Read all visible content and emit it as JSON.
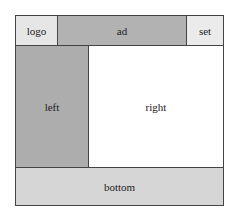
{
  "layout": {
    "logo": "logo",
    "ad": "ad",
    "set": "set",
    "left": "left",
    "right": "right",
    "bottom": "bottom"
  },
  "colors": {
    "logo": "#e6e6e6",
    "ad": "#b2b2b2",
    "set": "#ebebeb",
    "left": "#adadad",
    "right": "#ffffff",
    "bottom": "#d6d6d6",
    "border": "#444444"
  }
}
